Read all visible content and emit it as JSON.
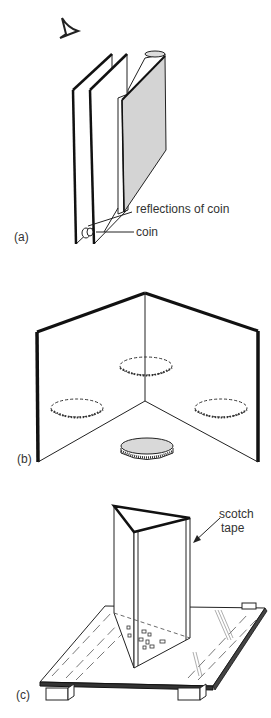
{
  "figure": {
    "panels": [
      {
        "id": "a",
        "label": "(a)",
        "description": "Two parallel mirrors beside a book with a coin between them",
        "annotations": {
          "reflections": "reflections of coin",
          "coin": "coin"
        }
      },
      {
        "id": "b",
        "label": "(b)",
        "description": "Two mirrors at a right angle with a coin and three reflections"
      },
      {
        "id": "c",
        "label": "(c)",
        "description": "Three mirrors taped into a triangular prism standing on a glass plate supported by two blocks",
        "annotations": {
          "tape": "scotch\ntape",
          "tape_line1": "scotch",
          "tape_line2": "tape"
        }
      }
    ]
  }
}
